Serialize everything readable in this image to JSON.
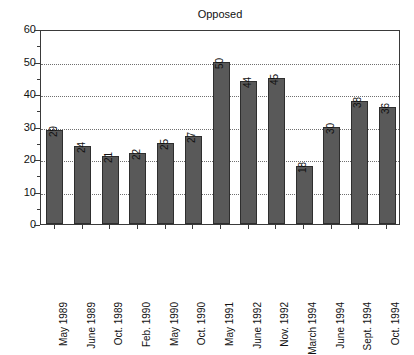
{
  "chart_data": {
    "type": "bar",
    "title": "Opposed",
    "xlabel": "",
    "ylabel": "",
    "ylim": [
      0,
      60
    ],
    "yticks": [
      0,
      10,
      20,
      30,
      40,
      50,
      60
    ],
    "yticks_minor": [
      5,
      15,
      25,
      35,
      45,
      55
    ],
    "grid": true,
    "grid_axis": "y",
    "legend": false,
    "bar_color": "#595959",
    "bar_edge_color": "#2e2e2e",
    "axis_color": "#3a3a3a",
    "grid_color": "#6f6f6f",
    "categories": [
      "May 1989",
      "June 1989",
      "Oct. 1989",
      "Feb. 1990",
      "May 1990",
      "Oct. 1990",
      "May 1991",
      "June 1992",
      "Nov. 1992",
      "March 1994",
      "June 1994",
      "Sept. 1994",
      "Oct. 1994"
    ],
    "values": [
      29,
      24,
      21,
      22,
      25,
      27,
      50,
      44,
      45,
      18,
      30,
      38,
      36
    ],
    "data_labels": [
      "29",
      "24",
      "21",
      "22",
      "25",
      "27",
      "50",
      "44",
      "45",
      "18",
      "30",
      "38",
      "36"
    ],
    "ytick_labels": [
      "0",
      "10",
      "20",
      "30",
      "40",
      "50",
      "60"
    ]
  }
}
